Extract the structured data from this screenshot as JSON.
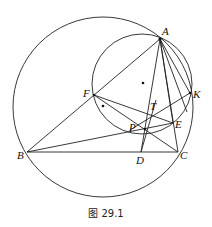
{
  "caption": "图 29.1",
  "points": {
    "A": {
      "label": "A",
      "x": 160,
      "y": 39
    },
    "B": {
      "label": "B",
      "x": 27,
      "y": 152
    },
    "C": {
      "label": "C",
      "x": 178,
      "y": 152
    },
    "D": {
      "label": "D",
      "x": 141,
      "y": 152
    },
    "E": {
      "label": "E",
      "x": 173,
      "y": 123
    },
    "F": {
      "label": "F",
      "x": 94,
      "y": 95
    },
    "K": {
      "label": "K",
      "x": 190,
      "y": 93
    },
    "P": {
      "label": "P",
      "x": 145,
      "y": 129
    },
    "T": {
      "label": "T",
      "x": 152,
      "y": 112
    }
  },
  "circles": [
    {
      "name": "circumcircle-ABC",
      "cx": 103,
      "cy": 107,
      "r": 90
    },
    {
      "name": "circle-AFK",
      "cx": 142,
      "cy": 83,
      "r": 50
    }
  ],
  "centers": [
    {
      "name": "center-small-circle",
      "x": 143,
      "y": 83
    },
    {
      "name": "center-other",
      "x": 103,
      "y": 106
    }
  ]
}
